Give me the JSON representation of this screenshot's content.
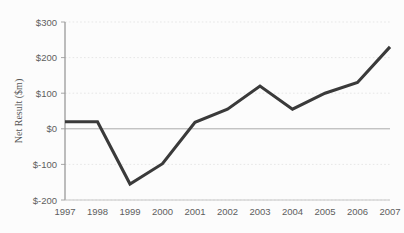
{
  "chart_data": {
    "type": "line",
    "title": "",
    "xlabel": "",
    "ylabel": "Net Result ($m)",
    "categories": [
      "1997",
      "1998",
      "1999",
      "2000",
      "2001",
      "2002",
      "2003",
      "2004",
      "2005",
      "2006",
      "2007"
    ],
    "x": [
      1997,
      1998,
      1999,
      2000,
      2001,
      2002,
      2003,
      2004,
      2005,
      2006,
      2007
    ],
    "values": [
      20,
      20,
      -155,
      -98,
      18,
      55,
      120,
      55,
      100,
      130,
      230
    ],
    "series": [
      {
        "name": "Net Result",
        "values": [
          20,
          20,
          -155,
          -98,
          18,
          55,
          120,
          55,
          100,
          130,
          230
        ]
      }
    ],
    "ylim": [
      -200,
      300
    ],
    "ytick_values": [
      300,
      200,
      100,
      0,
      -100,
      -200
    ],
    "ytick_labels": [
      "$300",
      "$200",
      "$100",
      "$0",
      "$-100",
      "$-200"
    ],
    "xtick_labels": [
      "1997",
      "1998",
      "1999",
      "2000",
      "2001",
      "2002",
      "2003",
      "2004",
      "2005",
      "2006",
      "2007"
    ],
    "grid": true,
    "grid_style": "dotted",
    "zero_line": true,
    "legend": false,
    "legend_position": "none",
    "markers": false,
    "line_color": "#111111",
    "grid_color": "#d8d8d8",
    "zero_line_color": "#9a9a9a",
    "axis_color": "#6f6f6f",
    "background_color": "#fdfdfd"
  }
}
